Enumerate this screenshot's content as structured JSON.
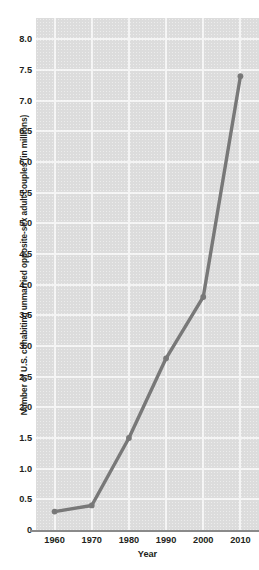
{
  "chart_data": {
    "type": "line",
    "title": "",
    "xlabel": "Year",
    "ylabel": "Number of U.S. cohabiting unmarried opposite-sex adult couples (in millions)",
    "x": [
      1960,
      1970,
      1980,
      1990,
      2000,
      2010
    ],
    "values": [
      0.3,
      0.4,
      1.5,
      2.8,
      3.8,
      7.4
    ],
    "series": [
      {
        "name": "Cohabiting unmarried opposite-sex adult couples",
        "values": [
          0.3,
          0.4,
          1.5,
          2.8,
          3.8,
          7.4
        ]
      }
    ],
    "xlim": [
      1955,
      2015
    ],
    "ylim": [
      0,
      8.35
    ],
    "xticks": [
      1960,
      1970,
      1980,
      1990,
      2000,
      2010
    ],
    "xtick_labels": [
      "1960",
      "1970",
      "1980",
      "1990",
      "2000",
      "2010"
    ],
    "yticks": [
      0,
      0.5,
      1.0,
      1.5,
      2.0,
      2.5,
      3.0,
      3.5,
      4.0,
      4.5,
      5.0,
      5.5,
      6.0,
      6.5,
      7.0,
      7.5,
      8.0
    ],
    "ytick_labels": [
      "0",
      "0.5",
      "1.0",
      "1.5",
      "2.0",
      "2.5",
      "3.0",
      "3.5",
      "4.0",
      "4.5",
      "5.0",
      "5.5",
      "6.0",
      "6.5",
      "7.0",
      "7.5",
      "8.0"
    ],
    "grid": true,
    "grid_color": "#f4f4f4",
    "legend": "none",
    "plot_background": "#dcdcdc",
    "line_color": "#787878",
    "marker": "circle",
    "marker_color": "#787878",
    "text_color": "#231f20"
  },
  "axes": {
    "y_title": "Number of U.S. cohabiting unmarried opposite-sex adult couples (in millions)",
    "x_title": "Year"
  }
}
